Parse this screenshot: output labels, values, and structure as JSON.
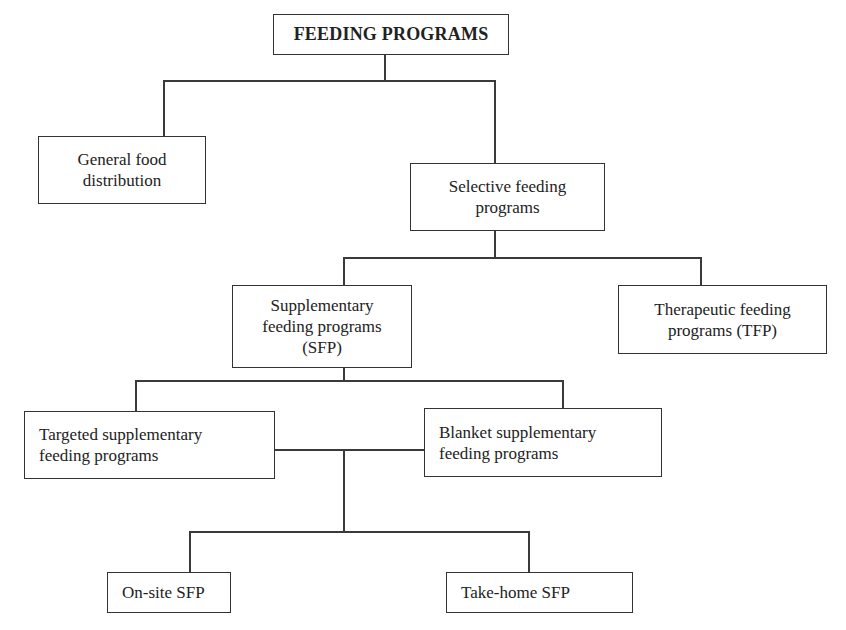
{
  "diagram": {
    "type": "hierarchy",
    "root": {
      "id": "feeding-programs",
      "label": "FEEDING PROGRAMS"
    },
    "nodes": {
      "general": {
        "lines": [
          "General food",
          "distribution"
        ]
      },
      "selective": {
        "lines": [
          "Selective feeding",
          "programs"
        ]
      },
      "sfp": {
        "lines": [
          "Supplementary",
          "feeding programs",
          "(SFP)"
        ]
      },
      "tfp": {
        "lines": [
          "Therapeutic feeding",
          "programs (TFP)"
        ]
      },
      "targeted": {
        "lines": [
          "Targeted supplementary",
          "feeding programs"
        ]
      },
      "blanket": {
        "lines": [
          "Blanket supplementary",
          "feeding programs"
        ]
      },
      "onsite": {
        "lines": [
          "On-site SFP"
        ]
      },
      "takehome": {
        "lines": [
          "Take-home SFP"
        ]
      }
    },
    "edges": [
      [
        "FEEDING PROGRAMS",
        "General food distribution"
      ],
      [
        "FEEDING PROGRAMS",
        "Selective feeding programs"
      ],
      [
        "Selective feeding programs",
        "Supplementary feeding programs (SFP)"
      ],
      [
        "Selective feeding programs",
        "Therapeutic feeding programs (TFP)"
      ],
      [
        "Supplementary feeding programs (SFP)",
        "Targeted supplementary feeding programs"
      ],
      [
        "Supplementary feeding programs (SFP)",
        "Blanket supplementary feeding programs"
      ],
      [
        "Targeted/Blanket supplementary feeding programs",
        "On-site SFP"
      ],
      [
        "Targeted/Blanket supplementary feeding programs",
        "Take-home SFP"
      ]
    ]
  }
}
